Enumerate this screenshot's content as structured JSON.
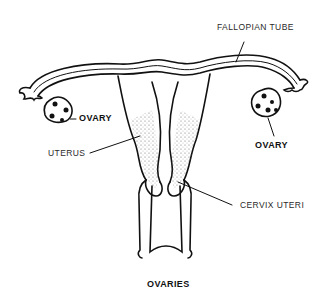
{
  "title": "OVARIES",
  "labels": {
    "fallopian_tube": "FALLOPIAN TUBE",
    "ovary_left": "OVARY",
    "ovary_right": "OVARY",
    "uterus": "UTERUS",
    "cervix": "CERVIX UTERI"
  },
  "colors": {
    "ink": "#111111",
    "background": "#ffffff"
  }
}
